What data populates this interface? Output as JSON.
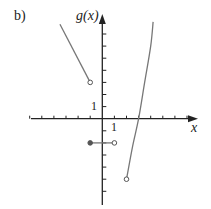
{
  "panel_label": "b)",
  "chart_data": {
    "type": "line",
    "title": "",
    "panel": "b)",
    "xlabel": "x",
    "ylabel": "g(x)",
    "x_tick_label": "1",
    "y_tick_label": "1",
    "xlim": [
      -6,
      8
    ],
    "ylim": [
      -6,
      8
    ],
    "grid": false,
    "tick_spacing": 1,
    "series": [
      {
        "name": "left-segment",
        "kind": "line",
        "points": [
          [
            -3.5,
            7.8
          ],
          [
            -1,
            3
          ]
        ],
        "endpoints": {
          "right": "open"
        }
      },
      {
        "name": "middle-segment",
        "kind": "line",
        "points": [
          [
            -1,
            -2
          ],
          [
            1,
            -2
          ]
        ],
        "endpoints": {
          "left": "closed",
          "right": "open"
        }
      },
      {
        "name": "right-curve",
        "kind": "curve",
        "points": [
          [
            2,
            -5
          ],
          [
            2.5,
            -2.3
          ],
          [
            3,
            0
          ],
          [
            3.5,
            3
          ],
          [
            4,
            6
          ],
          [
            4.2,
            8
          ]
        ],
        "endpoints": {
          "left": "open"
        }
      }
    ]
  }
}
